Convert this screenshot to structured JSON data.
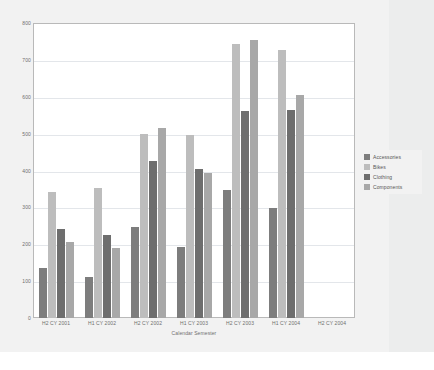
{
  "chart_data": {
    "type": "bar",
    "title": "",
    "subtitle": "",
    "xlabel": "Calendar Semester",
    "ylabel": "",
    "ylim": [
      0,
      800
    ],
    "ytick_step": 100,
    "ytick_labels": [
      "800",
      "700",
      "600",
      "500",
      "400",
      "300",
      "200",
      "100",
      "0"
    ],
    "grid": true,
    "legend_position": "right",
    "categories": [
      "H2 CY 2001",
      "H1 CY 2002",
      "H2 CY 2002",
      "H1 CY 2003",
      "H2 CY 2003",
      "H1 CY 2004",
      "H2 CY 2004"
    ],
    "series": [
      {
        "name": "Accessories",
        "color": "#7d7d7d",
        "values": [
          135,
          110,
          248,
          192,
          347,
          297,
          null
        ]
      },
      {
        "name": "Bikes",
        "color": "#bdbdbd",
        "values": [
          343,
          353,
          500,
          497,
          742,
          727,
          null
        ]
      },
      {
        "name": "Clothing",
        "color": "#6e6e6e",
        "values": [
          242,
          225,
          425,
          405,
          562,
          565,
          null
        ]
      },
      {
        "name": "Components",
        "color": "#a8a8a8",
        "values": [
          205,
          190,
          515,
          392,
          753,
          605,
          null
        ]
      }
    ]
  },
  "legend": {
    "items": [
      {
        "label": "Accessories",
        "color": "#7d7d7d"
      },
      {
        "label": "Bikes",
        "color": "#bdbdbd"
      },
      {
        "label": "Clothing",
        "color": "#6e6e6e"
      },
      {
        "label": "Components",
        "color": "#a8a8a8"
      }
    ]
  },
  "colors": {
    "page_background": "#f2f2f2",
    "plot_background": "#ffffff",
    "plot_border": "#b9b9b9",
    "gridline": "#e3e6ea",
    "tick_text": "#6f6f6f"
  }
}
